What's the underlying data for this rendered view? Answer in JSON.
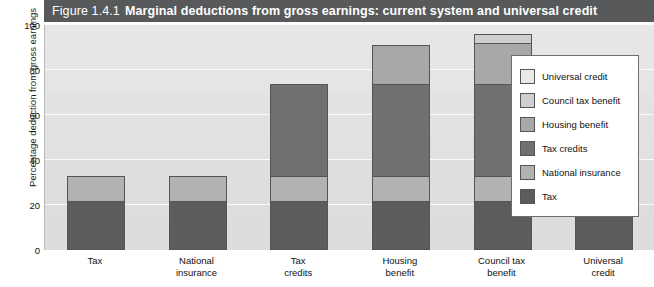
{
  "figure": {
    "number": "Figure 1.4.1",
    "title": "Marginal deductions from gross earnings: current system and universal credit",
    "header_bg": "#58595b",
    "header_fg": "#ffffff"
  },
  "chart_data": {
    "type": "bar",
    "stacked": true,
    "title": "Marginal deductions from gross earnings: current system and universal credit",
    "xlabel": "",
    "ylabel": "Percentage deduction from gross earnings",
    "ylim": [
      0,
      100
    ],
    "yticks": [
      0,
      20,
      40,
      60,
      80,
      100
    ],
    "grid": true,
    "legend_position": "right-inside",
    "categories": [
      "Tax",
      "National insurance",
      "Tax credits",
      "Housing benefit",
      "Council tax benefit",
      "Universal credit"
    ],
    "category_lines": [
      [
        "Tax"
      ],
      [
        "National",
        "insurance"
      ],
      [
        "Tax",
        "credits"
      ],
      [
        "Housing",
        "benefit"
      ],
      [
        "Council tax",
        "benefit"
      ],
      [
        "Universal",
        "credit"
      ]
    ],
    "series": [
      {
        "name": "Tax",
        "color": "#5c5c5c",
        "values": [
          22,
          22,
          22,
          22,
          22,
          21
        ]
      },
      {
        "name": "National insurance",
        "color": "#b2b2b2",
        "values": [
          11,
          11,
          11,
          11,
          11,
          12
        ]
      },
      {
        "name": "Tax credits",
        "color": "#707070",
        "values": [
          0,
          0,
          41,
          41,
          41,
          0
        ]
      },
      {
        "name": "Housing benefit",
        "color": "#a8a8a8",
        "values": [
          0,
          0,
          0,
          17,
          18,
          0
        ]
      },
      {
        "name": "Council tax benefit",
        "color": "#cfcfcf",
        "values": [
          0,
          0,
          0,
          0,
          4,
          0
        ]
      },
      {
        "name": "Universal credit",
        "color": "#e9e9e9",
        "values": [
          0,
          0,
          0,
          0,
          0,
          47
        ]
      }
    ],
    "totals": [
      33,
      33,
      74,
      91,
      96,
      80
    ]
  },
  "legend": {
    "entries": [
      {
        "label": "Universal credit",
        "color": "#e9e9e9"
      },
      {
        "label": "Council tax benefit",
        "color": "#cfcfcf"
      },
      {
        "label": "Housing benefit",
        "color": "#a8a8a8"
      },
      {
        "label": "Tax credits",
        "color": "#707070"
      },
      {
        "label": "National insurance",
        "color": "#b2b2b2"
      },
      {
        "label": "Tax",
        "color": "#5c5c5c"
      }
    ]
  }
}
